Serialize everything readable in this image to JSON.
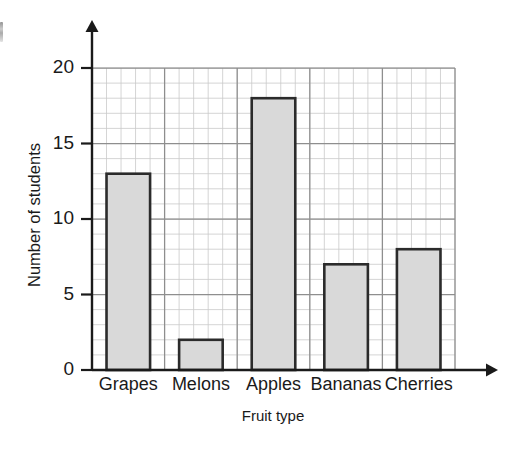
{
  "chart_data": {
    "type": "bar",
    "title": "",
    "subtitle": "",
    "xlabel": "Fruit type",
    "ylabel": "Number of students",
    "categories": [
      "Grapes",
      "Melons",
      "Apples",
      "Bananas",
      "Cherries"
    ],
    "values": [
      13,
      2,
      18,
      7,
      8
    ],
    "ylim": [
      0,
      20
    ],
    "y_tick_labels": [
      "0",
      "5",
      "10",
      "15",
      "20"
    ],
    "y_tick_values": [
      0,
      5,
      10,
      15,
      20
    ],
    "y_minor_step": 1,
    "grid": "on",
    "legend": "none",
    "bar_fill_color": "#d9d9d9",
    "bar_edge_color": "#2b2b2b",
    "axis_color": "#1a1a1a",
    "grid_minor_color": "#c9c9c9",
    "grid_major_color": "#8e8e8e"
  },
  "axes": {
    "y_axis_title": "Number of students",
    "x_axis_title": "Fruit type",
    "y_ticks": [
      {
        "label": "20",
        "value": 20
      },
      {
        "label": "15",
        "value": 15
      },
      {
        "label": "10",
        "value": 10
      },
      {
        "label": "5",
        "value": 5
      },
      {
        "label": "0",
        "value": 0
      }
    ]
  },
  "bars": [
    {
      "label": "Grapes",
      "value": 13
    },
    {
      "label": "Melons",
      "value": 2
    },
    {
      "label": "Apples",
      "value": 18
    },
    {
      "label": "Bananas",
      "value": 7
    },
    {
      "label": "Cherries",
      "value": 8
    }
  ]
}
